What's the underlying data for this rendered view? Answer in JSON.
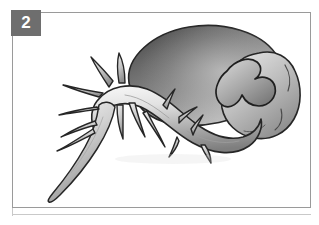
{
  "panel": {
    "badge_label": "2",
    "badge_bg_color": "#6e6e6e",
    "badge_text_color": "#ffffff",
    "frame_border_color": "#9a9a9a",
    "background_color": "#ffffff"
  },
  "illustration": {
    "subject": "germinating-seed",
    "style": "grayscale-shaded-line-drawing",
    "outline_color": "#2b2b2b",
    "fill_light": "#f2f2f2",
    "fill_mid": "#b0b0b0",
    "fill_dark": "#5c5c5c",
    "parts": [
      {
        "name": "cotyledon-seed-body",
        "description": "large tilted ellipsoid seed body, dark upper-left shading fading lighter toward lower-right",
        "shade_light": "#d8d8d8",
        "shade_dark": "#555555"
      },
      {
        "name": "hypocotyl-axis",
        "description": "thick curved tubular axis sweeping from lower-left up to the right beneath the seed body",
        "shade_light": "#ececec",
        "shade_dark": "#8e8e8e"
      },
      {
        "name": "radicle-tip",
        "description": "tapering primary root tip descending to the lower-left corner",
        "shade_light": "#e6e6e6",
        "shade_dark": "#8a8a8a"
      },
      {
        "name": "lateral-root-spines",
        "description": "thorn-like lateral rootlets branching from the axis",
        "count": 14
      },
      {
        "name": "embryo-lobe",
        "description": "lobed bulbous embryo/plumule mass at the right end wrapping around the axis",
        "shade_light": "#dcdcdc",
        "shade_dark": "#777777"
      }
    ]
  }
}
